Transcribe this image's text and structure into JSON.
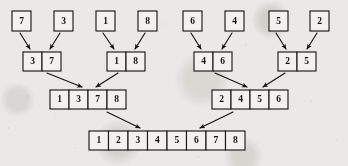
{
  "figure": {
    "background_color": "#ebe9e6",
    "ink_color": "#16140f",
    "box_fill_color": "#f3f1ee"
  },
  "chart_data": {
    "type": "diagram",
    "levels": [
      {
        "level": 0,
        "name": "singletons",
        "arrays": [
          {
            "values": [
              "7"
            ],
            "x": 12,
            "y": 11,
            "cell_width": 19,
            "cell_height": 20
          },
          {
            "values": [
              "3"
            ],
            "x": 54,
            "y": 11,
            "cell_width": 19,
            "cell_height": 20
          },
          {
            "values": [
              "1"
            ],
            "x": 96,
            "y": 11,
            "cell_width": 19,
            "cell_height": 20
          },
          {
            "values": [
              "8"
            ],
            "x": 138,
            "y": 11,
            "cell_width": 19,
            "cell_height": 20
          },
          {
            "values": [
              "6"
            ],
            "x": 183,
            "y": 11,
            "cell_width": 19,
            "cell_height": 20
          },
          {
            "values": [
              "4"
            ],
            "x": 225,
            "y": 11,
            "cell_width": 19,
            "cell_height": 20
          },
          {
            "values": [
              "5"
            ],
            "x": 269,
            "y": 11,
            "cell_width": 19,
            "cell_height": 20
          },
          {
            "values": [
              "2"
            ],
            "x": 310,
            "y": 11,
            "cell_width": 19,
            "cell_height": 20
          }
        ]
      },
      {
        "level": 1,
        "name": "pairs",
        "arrays": [
          {
            "values": [
              "3",
              "7"
            ],
            "x": 23,
            "y": 52,
            "cell_width": 19,
            "cell_height": 19
          },
          {
            "values": [
              "1",
              "8"
            ],
            "x": 107,
            "y": 52,
            "cell_width": 19,
            "cell_height": 19
          },
          {
            "values": [
              "4",
              "6"
            ],
            "x": 194,
            "y": 52,
            "cell_width": 19,
            "cell_height": 19
          },
          {
            "values": [
              "2",
              "5"
            ],
            "x": 278,
            "y": 52,
            "cell_width": 19,
            "cell_height": 19
          }
        ]
      },
      {
        "level": 2,
        "name": "quads",
        "arrays": [
          {
            "values": [
              "1",
              "3",
              "7",
              "8"
            ],
            "x": 50,
            "y": 90,
            "cell_width": 19,
            "cell_height": 19
          },
          {
            "values": [
              "2",
              "4",
              "5",
              "6"
            ],
            "x": 212,
            "y": 90,
            "cell_width": 19,
            "cell_height": 19
          }
        ]
      },
      {
        "level": 3,
        "name": "sorted",
        "arrays": [
          {
            "values": [
              "1",
              "2",
              "3",
              "4",
              "5",
              "6",
              "7",
              "8"
            ],
            "x": 89,
            "y": 131,
            "cell_width": 19.5,
            "cell_height": 19
          }
        ]
      }
    ],
    "arrows": [
      {
        "name": "arrow-7-to-pair-37",
        "x1": 20,
        "y1": 33,
        "x2": 30,
        "y2": 49
      },
      {
        "name": "arrow-3-to-pair-37",
        "x1": 60,
        "y1": 33,
        "x2": 50,
        "y2": 49
      },
      {
        "name": "arrow-1-to-pair-18",
        "x1": 103,
        "y1": 33,
        "x2": 114,
        "y2": 49
      },
      {
        "name": "arrow-8-to-pair-18",
        "x1": 145,
        "y1": 33,
        "x2": 135,
        "y2": 49
      },
      {
        "name": "arrow-6-to-pair-46",
        "x1": 191,
        "y1": 33,
        "x2": 201,
        "y2": 49
      },
      {
        "name": "arrow-4-to-pair-46",
        "x1": 232,
        "y1": 33,
        "x2": 222,
        "y2": 49
      },
      {
        "name": "arrow-5-to-pair-25",
        "x1": 276,
        "y1": 33,
        "x2": 286,
        "y2": 49
      },
      {
        "name": "arrow-2-to-pair-25",
        "x1": 317,
        "y1": 33,
        "x2": 307,
        "y2": 49
      },
      {
        "name": "arrow-pair37-to-quad1378",
        "x1": 47,
        "y1": 73,
        "x2": 82,
        "y2": 87
      },
      {
        "name": "arrow-pair18-to-quad1378",
        "x1": 118,
        "y1": 73,
        "x2": 96,
        "y2": 87
      },
      {
        "name": "arrow-pair46-to-quad2456",
        "x1": 215,
        "y1": 73,
        "x2": 247,
        "y2": 87
      },
      {
        "name": "arrow-pair25-to-quad2456",
        "x1": 285,
        "y1": 73,
        "x2": 263,
        "y2": 87
      },
      {
        "name": "arrow-quad1378-to-sorted",
        "x1": 107,
        "y1": 112,
        "x2": 140,
        "y2": 128
      },
      {
        "name": "arrow-quad2456-to-sorted",
        "x1": 233,
        "y1": 112,
        "x2": 200,
        "y2": 128
      }
    ]
  }
}
